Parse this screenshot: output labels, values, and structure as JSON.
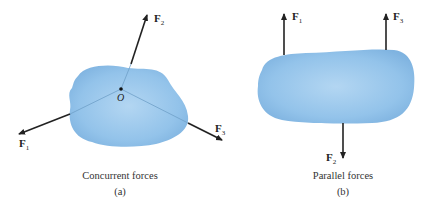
{
  "panel_a": {
    "caption": "Concurrent forces",
    "sublabel": "(a)",
    "point_label": "O",
    "forces": [
      {
        "name": "F",
        "sub": "1"
      },
      {
        "name": "F",
        "sub": "2"
      },
      {
        "name": "F",
        "sub": "3"
      }
    ]
  },
  "panel_b": {
    "caption": "Parallel forces",
    "sublabel": "(b)",
    "forces": [
      {
        "name": "F",
        "sub": "1"
      },
      {
        "name": "F",
        "sub": "2"
      },
      {
        "name": "F",
        "sub": "3"
      }
    ]
  },
  "colors": {
    "body": "#8fc0e8",
    "arrow": "#222222"
  }
}
